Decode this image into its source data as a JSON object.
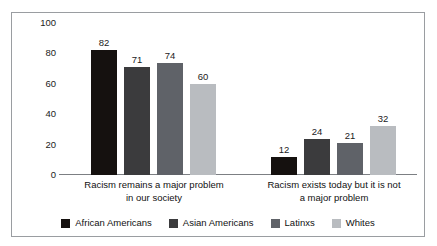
{
  "chart_data": {
    "type": "bar",
    "title": "",
    "xlabel": "",
    "ylabel": "",
    "ylim": [
      0,
      100
    ],
    "yticks": [
      "0",
      "20",
      "40",
      "60",
      "80",
      "100"
    ],
    "grid": false,
    "legend_position": "bottom",
    "categories": [
      "Racism remains a major problem in our society",
      "Racism exists today but it is not a major problem"
    ],
    "category_lines": [
      [
        "Racism remains a major problem",
        "in our society"
      ],
      [
        "Racism exists today but it is not",
        "a major problem"
      ]
    ],
    "series": [
      {
        "name": "African Americans",
        "color": "#15110f",
        "values": [
          82,
          12
        ]
      },
      {
        "name": "Asian Americans",
        "color": "#3b3b3d",
        "values": [
          71,
          24
        ]
      },
      {
        "name": "Latinxs",
        "color": "#5f6268",
        "values": [
          74,
          21
        ]
      },
      {
        "name": "Whites",
        "color": "#b9bcc0",
        "values": [
          60,
          32
        ]
      }
    ]
  },
  "colors": {
    "frame_border": "#9a9da1",
    "axis_line": "#7c7f83",
    "text": "#111111",
    "background": "#ffffff"
  }
}
